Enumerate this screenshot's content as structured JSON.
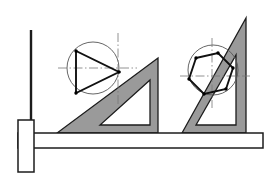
{
  "figure": {
    "caption": "T-square and set-square triangles positioned over two construction circles",
    "width": 278,
    "height": 178,
    "background_color": "#ffffff"
  },
  "colors": {
    "paper": "#ffffff",
    "tool_fill": "#9a9a9a",
    "tool_outline": "#1c1c1c",
    "construction_line": "#555555",
    "object_line": "#111111",
    "center_line": "#777777",
    "vertex_dot": "#000000"
  },
  "line_weights": {
    "object_line": 1.9,
    "construction_circle": 0.9,
    "center_line": 0.8,
    "tool_outline": 1.3,
    "tsquare_outline": 1.5
  },
  "tsquare": {
    "name": "T-square",
    "head": {
      "label": "T-square head",
      "x": 18,
      "y": 120,
      "width": 16,
      "height": 52
    },
    "blade": {
      "label": "T-square blade",
      "x": 18,
      "y": 133,
      "width": 245,
      "height": 15
    },
    "stock_edge_x": 34,
    "working_edge_y": 133
  },
  "vertical_guide": {
    "name": "vertical reference line",
    "x": 31,
    "y_top": 30,
    "y_bottom": 152,
    "width": 2.4
  },
  "set_squares": [
    {
      "id": "left-set-square",
      "label": "30-60-90 set square (shallow)",
      "angle_label": "30 degrees",
      "outline": [
        [
          57,
          133
        ],
        [
          158,
          133
        ],
        [
          158,
          58
        ]
      ],
      "cutout": [
        [
          100,
          125
        ],
        [
          150,
          125
        ],
        [
          150,
          80
        ]
      ],
      "has_cutout": true
    },
    {
      "id": "right-set-square",
      "label": "30-60-90 set square (steep)",
      "angle_label": "60 degrees",
      "outline": [
        [
          182,
          133
        ],
        [
          246,
          133
        ],
        [
          246,
          18
        ]
      ],
      "cutout": [
        [
          196,
          125
        ],
        [
          236,
          125
        ],
        [
          236,
          55
        ]
      ],
      "has_cutout": true
    }
  ],
  "constructions": [
    {
      "id": "left-construction",
      "label": "Equilateral triangle inscribed in circle",
      "circle": {
        "label": "construction circle",
        "cx": 93,
        "cy": 68,
        "r": 26
      },
      "center_lines": {
        "horizontal": {
          "x1": 58,
          "y1": 68,
          "x2": 137,
          "y2": 68
        },
        "vertical": {
          "x1": 118,
          "y1": 33,
          "x2": 118,
          "y2": 104
        }
      },
      "inscribed_shape": {
        "type": "triangle",
        "sides": 3,
        "vertices": [
          [
            76,
            51
          ],
          [
            76,
            93
          ],
          [
            119,
            72
          ]
        ],
        "vertex_count": 3
      }
    },
    {
      "id": "right-construction",
      "label": "Regular hexagon inscribed in circle",
      "circle": {
        "label": "construction circle",
        "cx": 213,
        "cy": 70,
        "r": 25
      },
      "center_lines": {
        "horizontal": {
          "x1": 180,
          "y1": 76,
          "x2": 250,
          "y2": 76
        },
        "vertical": {
          "x1": 212,
          "y1": 38,
          "x2": 212,
          "y2": 108
        }
      },
      "inscribed_shape": {
        "type": "hexagon",
        "sides": 6,
        "vertices": [
          [
            196,
            58
          ],
          [
            218,
            53
          ],
          [
            233,
            68
          ],
          [
            226,
            89
          ],
          [
            204,
            94
          ],
          [
            189,
            79
          ]
        ],
        "vertex_count": 6
      }
    }
  ],
  "legend": {
    "items": [
      {
        "key": "tool_fill",
        "label": "Drafting tool (shaded)"
      },
      {
        "key": "object_line",
        "label": "Inscribed polygon (heavy line)"
      },
      {
        "key": "construction_line",
        "label": "Construction circle (thin line)"
      },
      {
        "key": "center_line",
        "label": "Centerline (dash-dot)"
      }
    ]
  }
}
